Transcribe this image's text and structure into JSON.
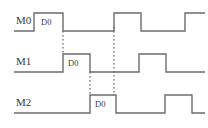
{
  "figure": {
    "type": "timing-diagram",
    "title": "",
    "width": 208,
    "height": 128,
    "background": "#ffffff",
    "wave_color": "#6b6b6b",
    "marker_color": "#4a4a4a",
    "text_color": "#3a3a3a"
  },
  "signals": [
    {
      "name": "M0",
      "label": "M0",
      "label_x": 16,
      "label_y": 24,
      "baseline_y": 31,
      "high_y": 13,
      "start_x": 14,
      "end_x": 205,
      "data_label": "D0",
      "data_label_x": 41,
      "data_label_y": 25,
      "pulses": [
        {
          "rise": 34,
          "fall": 63
        },
        {
          "rise": 114,
          "fall": 141
        },
        {
          "rise": 185,
          "fall": 205
        }
      ]
    },
    {
      "name": "M1",
      "label": "M1",
      "label_x": 16,
      "label_y": 65,
      "baseline_y": 72,
      "high_y": 54,
      "start_x": 14,
      "end_x": 205,
      "data_label": "D0",
      "data_label_x": 68,
      "data_label_y": 66,
      "pulses": [
        {
          "rise": 63,
          "fall": 90
        },
        {
          "rise": 139,
          "fall": 166
        }
      ]
    },
    {
      "name": "M2",
      "label": "M2",
      "label_x": 16,
      "label_y": 106,
      "baseline_y": 113,
      "high_y": 95,
      "start_x": 14,
      "end_x": 205,
      "data_label": "D0",
      "data_label_x": 95,
      "data_label_y": 107,
      "pulses": [
        {
          "rise": 90,
          "fall": 116
        },
        {
          "rise": 165,
          "fall": 192
        }
      ]
    }
  ],
  "markers": [
    {
      "name": "marker-m0-fall-to-m1-rise",
      "x": 63,
      "y1": 31,
      "y2": 54
    },
    {
      "name": "marker-m1-fall-to-m2-rise",
      "x": 90,
      "y1": 72,
      "y2": 95
    },
    {
      "name": "marker-m0-rise-span",
      "x": 114,
      "y1": 27,
      "y2": 95
    }
  ],
  "chart_data": {
    "type": "timing",
    "title": "",
    "xlabel": "",
    "ylabel": "",
    "categories": [
      "M0",
      "M1",
      "M2"
    ],
    "series": [
      {
        "name": "M0",
        "annotation": "D0",
        "pulses": [
          [
            34,
            63
          ],
          [
            114,
            141
          ],
          [
            185,
            205
          ]
        ]
      },
      {
        "name": "M1",
        "annotation": "D0",
        "pulses": [
          [
            63,
            90
          ],
          [
            139,
            166
          ]
        ]
      },
      {
        "name": "M2",
        "annotation": "D0",
        "pulses": [
          [
            90,
            116
          ],
          [
            165,
            192
          ]
        ]
      }
    ],
    "markers": [
      63,
      90,
      114
    ]
  }
}
